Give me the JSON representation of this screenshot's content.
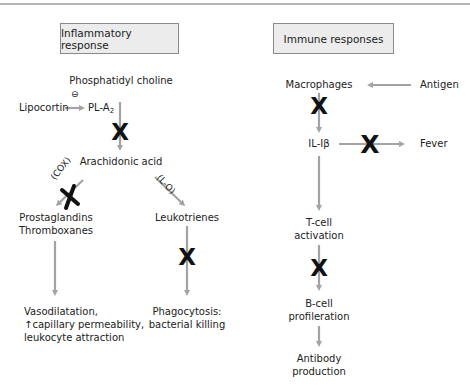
{
  "left_panel": {
    "title": "Inflammatory response",
    "nodes": {
      "phosphatidyl_choline": "Phosphatidyl choline",
      "lipocortin": "Lipocortin",
      "pla2_main": "PL-A",
      "pla2_sub": "2",
      "arachidonic_acid": "Arachidonic acid",
      "prostaglandins_line1": "Prostaglandins",
      "prostaglandins_line2": "Thromboxanes",
      "leukotrienes": "Leukotrienes",
      "vaso_line1": "Vasodilatation,",
      "vaso_line2": "↑capillary permeability,",
      "vaso_line3": "leukocyte attraction",
      "phago_line1": "Phagocytosis:",
      "phago_line2": "bacterial killing"
    },
    "edge_labels": {
      "cox": "(COX)",
      "lo": "(L-O)",
      "inhibit_symbol": "⊖"
    }
  },
  "right_panel": {
    "title": "Immune responses",
    "nodes": {
      "macrophages": "Macrophages",
      "antigen": "Antigen",
      "il1b": "IL-Iβ",
      "fever": "Fever",
      "tcell_line1": "T-cell",
      "tcell_line2": "activation",
      "bcell_line1": "B-cell",
      "bcell_line2": "profileration",
      "antibody_line1": "Antibody",
      "antibody_line2": "production"
    }
  },
  "colors": {
    "arrow": "#a3a3a3",
    "block_mark": "#111111",
    "box_fill": "#ececec",
    "box_border": "#8a8a8a"
  }
}
